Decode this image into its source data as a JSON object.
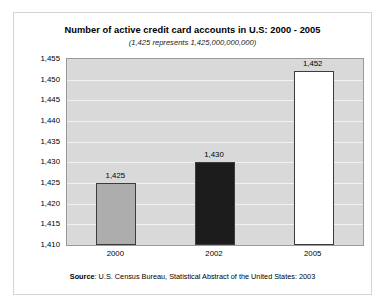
{
  "chart_data": {
    "type": "bar",
    "title": "Number of active credit card accounts in U.S: 2000 - 2005",
    "subtitle": "(1,425 represents 1,425,000,000,000)",
    "categories": [
      "2000",
      "2002",
      "2005"
    ],
    "values": [
      1425,
      1430,
      1452
    ],
    "data_labels": [
      "1,425",
      "1,430",
      "1,452"
    ],
    "xlabel": "",
    "ylabel": "",
    "ylim": [
      1410,
      1455
    ],
    "ytick_step": 5,
    "ytick_labels": [
      "1,455",
      "1,450",
      "1,445",
      "1,440",
      "1,435",
      "1,430",
      "1,425",
      "1,420",
      "1,415",
      "1,410"
    ],
    "ytick_values": [
      1455,
      1450,
      1445,
      1440,
      1435,
      1430,
      1425,
      1420,
      1415,
      1410
    ],
    "grid": true,
    "legend": "none",
    "bar_colors": [
      "#adadad",
      "#1c1c1c",
      "#ffffff"
    ],
    "bar_border_color": "#3c3c3c",
    "plot_background": "#d9d9d9",
    "gridline_color": "#f1f1f1"
  },
  "source": {
    "label": "Source",
    "text": ": U.S. Census Bureau, Statistical Abstract of the United States: 2003"
  }
}
